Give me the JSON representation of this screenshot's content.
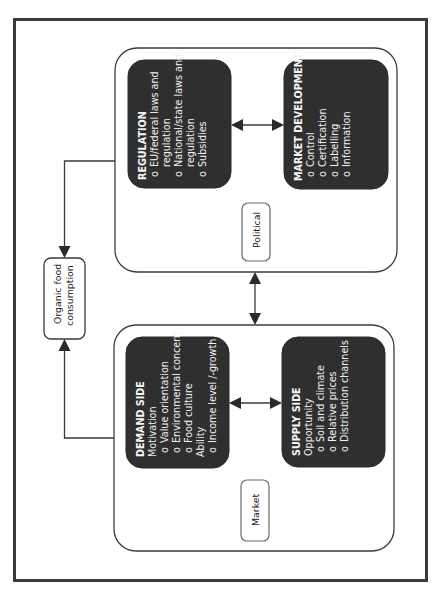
{
  "diagram": {
    "orientation": "rotated-90-ccw",
    "outcome": {
      "line1": "Organic food",
      "line2": "consumption"
    },
    "groups": {
      "political": {
        "label": "Political",
        "regulation": {
          "title": "REGULATION",
          "items": [
            {
              "bullet": "o",
              "lines": [
                "EU/federal laws and",
                "regulation"
              ]
            },
            {
              "bullet": "o",
              "lines": [
                "National/state laws and",
                "regulation"
              ]
            },
            {
              "bullet": "o",
              "lines": [
                "Subsidies"
              ]
            }
          ]
        },
        "market_development": {
          "title": "MARKET DEVELOPMENT",
          "items": [
            {
              "bullet": "o",
              "lines": [
                "Control"
              ]
            },
            {
              "bullet": "o",
              "lines": [
                "Certification"
              ]
            },
            {
              "bullet": "o",
              "lines": [
                "Labelling"
              ]
            },
            {
              "bullet": "o",
              "lines": [
                "Information"
              ]
            }
          ]
        }
      },
      "market": {
        "label": "Market",
        "demand_side": {
          "title": "DEMAND SIDE",
          "sections": [
            {
              "heading": "Motivation",
              "items": [
                "Value orientation",
                "Environmental concern",
                "Food culture"
              ]
            },
            {
              "heading": "Ability",
              "items": [
                "Income level /-growth"
              ]
            }
          ]
        },
        "supply_side": {
          "title": "SUPPLY SIDE",
          "sections": [
            {
              "heading": "Opportunity",
              "items": [
                "Soil and climate",
                "Relative prices",
                "Distribution channels"
              ]
            }
          ]
        }
      }
    },
    "connections": [
      {
        "from": "regulation",
        "to": "market_development",
        "type": "bidirectional"
      },
      {
        "from": "demand_side",
        "to": "supply_side",
        "type": "bidirectional"
      },
      {
        "from": "political",
        "to": "market",
        "type": "bidirectional"
      },
      {
        "from": "political",
        "to": "organic_food_consumption",
        "type": "directed"
      },
      {
        "from": "market",
        "to": "organic_food_consumption",
        "type": "directed"
      }
    ],
    "colors": {
      "frame": "#3a3a3a",
      "dark_box_fill": "#2f2f2f",
      "dark_box_text": "#f2f2f2",
      "background": "#ffffff"
    }
  }
}
